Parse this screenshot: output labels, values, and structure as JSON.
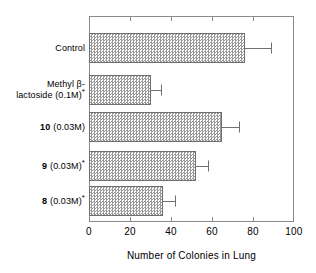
{
  "chart_data": {
    "type": "bar",
    "orientation": "horizontal",
    "title": "",
    "xlabel": "Number of Colonies in Lung",
    "ylabel": "",
    "xlim": [
      0,
      100
    ],
    "xticks": [
      0,
      20,
      40,
      60,
      80,
      100
    ],
    "grid": false,
    "legend": null,
    "categories": [
      "Control",
      "Methyl β-lactoside (0.1M)*",
      "10 (0.03M)",
      "9 (0.03M)*",
      "8 (0.03M)*"
    ],
    "values": [
      76,
      30,
      65,
      52,
      36
    ],
    "errors_upper": [
      13,
      5,
      8,
      6,
      6
    ],
    "error_cap_values": [
      89,
      35,
      73,
      58,
      42
    ],
    "bar_fill": "#9a9a9a",
    "bar_edge": "#6f6f6f"
  },
  "axis": {
    "x_title": "Number of Colonies in Lung",
    "x_tick_labels": [
      "0",
      "20",
      "40",
      "60",
      "80",
      "100"
    ]
  },
  "categories": [
    {
      "id": "control",
      "lines": [
        {
          "num": "",
          "text": "Control",
          "star": false
        }
      ]
    },
    {
      "id": "methyl-beta-lactoside",
      "lines": [
        {
          "num": "",
          "text": "Methyl β-",
          "star": false
        },
        {
          "num": "",
          "text": "lactoside (0.1M)",
          "star": true
        }
      ]
    },
    {
      "id": "compound-10",
      "lines": [
        {
          "num": "10",
          "text": "(0.03M)",
          "star": false
        }
      ]
    },
    {
      "id": "compound-9",
      "lines": [
        {
          "num": "9",
          "text": "(0.03M)",
          "star": true
        }
      ]
    },
    {
      "id": "compound-8",
      "lines": [
        {
          "num": "8",
          "text": "(0.03M)",
          "star": true
        }
      ]
    }
  ],
  "caption_fragment": ""
}
